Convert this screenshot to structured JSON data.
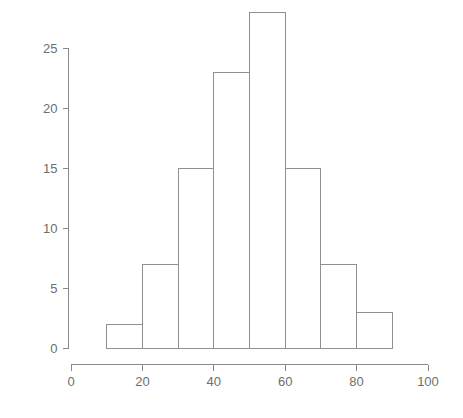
{
  "chart_data": {
    "type": "bar",
    "title": "",
    "subtitle": "",
    "xlabel": "",
    "ylabel": "",
    "xlim": [
      0,
      100
    ],
    "ylim": [
      0,
      28
    ],
    "grid": false,
    "legend": false,
    "bin_width": 10,
    "bin_edges": [
      10,
      20,
      30,
      40,
      50,
      60,
      70,
      80,
      90
    ],
    "categories": [
      "10-20",
      "20-30",
      "30-40",
      "40-50",
      "50-60",
      "60-70",
      "70-80",
      "80-90"
    ],
    "values": [
      2,
      7,
      15,
      23,
      28,
      15,
      7,
      3
    ],
    "x_ticks": [
      0,
      20,
      40,
      60,
      80,
      100
    ],
    "x_tick_labels": [
      "0",
      "20",
      "40",
      "60",
      "80",
      "100"
    ],
    "y_ticks": [
      0,
      5,
      10,
      15,
      20,
      25
    ],
    "y_tick_labels": [
      "0",
      "5",
      "10",
      "15",
      "20",
      "25"
    ],
    "colors": {
      "background": "#ffffff",
      "axis": "#8a8a8a",
      "bar_stroke": "#8f8f8f",
      "bar_fill": "none",
      "tick_label": "#6e6e6e"
    }
  }
}
